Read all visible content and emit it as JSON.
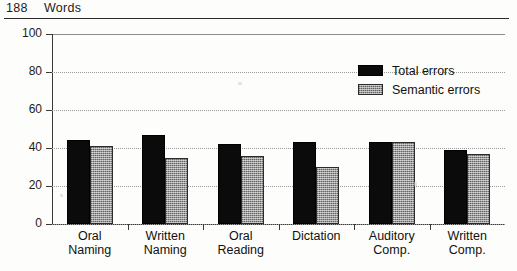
{
  "running_head": {
    "page_number": "188",
    "title": "Words"
  },
  "chart_data": {
    "type": "bar",
    "title": "",
    "subtitle": "",
    "xlabel": "",
    "ylabel": "",
    "ylim": [
      0,
      100
    ],
    "yticks": [
      0,
      20,
      40,
      60,
      80,
      100
    ],
    "grid": true,
    "legend_position": "upper-right-inside",
    "categories": [
      "Oral Naming",
      "Written Naming",
      "Oral Reading",
      "Dictation",
      "Auditory Comp.",
      "Written Comp."
    ],
    "category_lines": [
      [
        "Oral",
        "Naming"
      ],
      [
        "Written",
        "Naming"
      ],
      [
        "Oral",
        "Reading"
      ],
      [
        "Dictation",
        ""
      ],
      [
        "Auditory",
        "Comp."
      ],
      [
        "Written",
        "Comp."
      ]
    ],
    "series": [
      {
        "name": "Total errors",
        "color": "#0b0b0b",
        "values": [
          44,
          47,
          42,
          43,
          43,
          39
        ]
      },
      {
        "name": "Semantic errors",
        "color": "#9a9a9a",
        "values": [
          41,
          35,
          36,
          30,
          43,
          37
        ]
      }
    ]
  }
}
